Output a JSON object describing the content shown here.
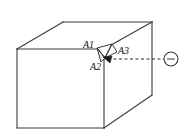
{
  "figure": {
    "kind": "line-drawing",
    "background_color": "#ffffff",
    "line_color": "#3b3b3b",
    "label_color": "#121212",
    "stroke_width": 1.1
  },
  "box": {
    "name": "rectangular-box",
    "front_face": {
      "name": "front-face",
      "points": "17,49 17,128 104,128 104,49"
    },
    "top_face": {
      "name": "top-face",
      "points": "17,49 63,22 152,22 104,49"
    },
    "right_face": {
      "name": "right-face",
      "points": "104,49 152,22 152,95 104,128"
    },
    "edges": [
      {
        "name": "edge-front-top",
        "x1": 17,
        "y1": 49,
        "x2": 104,
        "y2": 49
      },
      {
        "name": "edge-front-left",
        "x1": 17,
        "y1": 49,
        "x2": 17,
        "y2": 128
      },
      {
        "name": "edge-front-bottom",
        "x1": 17,
        "y1": 128,
        "x2": 104,
        "y2": 128
      },
      {
        "name": "edge-front-right-vertical",
        "x1": 104,
        "y1": 49,
        "x2": 104,
        "y2": 128
      },
      {
        "name": "edge-top-left-receding",
        "x1": 17,
        "y1": 49,
        "x2": 63,
        "y2": 22
      },
      {
        "name": "edge-top-back",
        "x1": 63,
        "y1": 22,
        "x2": 152,
        "y2": 22
      },
      {
        "name": "edge-top-right-receding",
        "x1": 104,
        "y1": 49,
        "x2": 152,
        "y2": 22
      },
      {
        "name": "edge-back-right-vertical",
        "x1": 152,
        "y1": 22,
        "x2": 152,
        "y2": 95
      },
      {
        "name": "edge-bottom-right-receding",
        "x1": 104,
        "y1": 128,
        "x2": 152,
        "y2": 95
      }
    ]
  },
  "defect": {
    "name": "corner-notch",
    "description": "small triangular chip cut into the top-front-right corner region",
    "facet_a1": "97,48 112,44 105,58",
    "facet_a2": "97,48 105,58 101,62",
    "facet_a3": "112,44 117,52 105,58",
    "outline": "97,48 112,44 117,52 105,58 101,62",
    "internal_edges": [
      {
        "name": "notch-edge-a1-a3",
        "x1": 112,
        "y1": 44,
        "x2": 105,
        "y2": 58
      },
      {
        "name": "notch-edge-a1-a2",
        "x1": 97,
        "y1": 48,
        "x2": 105,
        "y2": 58
      },
      {
        "name": "notch-edge-a2-lower",
        "x1": 101,
        "y1": 62,
        "x2": 105,
        "y2": 58
      }
    ]
  },
  "labels": [
    {
      "name": "label-a1",
      "text": "A1",
      "x": 83,
      "y": 48
    },
    {
      "name": "label-a2",
      "text": "A2",
      "x": 90,
      "y": 70
    },
    {
      "name": "label-a3",
      "text": "A3",
      "x": 118,
      "y": 54
    }
  ],
  "sight_line": {
    "name": "viewing-sight-line",
    "style": "dashed",
    "dash_pattern": "3,2.5",
    "x1": 108,
    "y1": 59,
    "x2": 164,
    "y2": 59,
    "arrow_head": {
      "name": "sight-line-arrowhead",
      "points": "103,57 112,56 110,63"
    }
  },
  "viewpoint": {
    "name": "viewpoint-marker",
    "symbol": "circle-with-horizontal-bar",
    "cx": 171,
    "cy": 59,
    "r": 7,
    "inner_bar": {
      "x1": 167,
      "y1": 59,
      "x2": 175,
      "y2": 59
    }
  }
}
